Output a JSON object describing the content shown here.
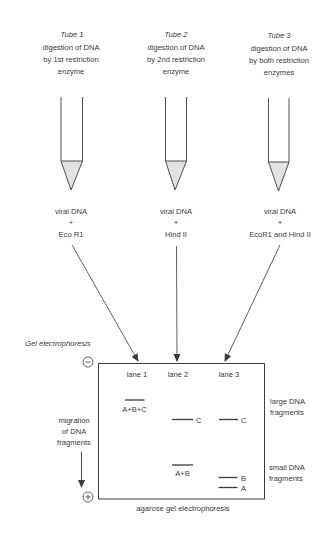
{
  "tubes": [
    {
      "title": "Tube 1",
      "description": [
        "digestion of DNA",
        "by 1st restriction",
        "enzyme"
      ],
      "contents": [
        "viral DNA",
        "+",
        "Eco R1"
      ]
    },
    {
      "title": "Tube 2",
      "description": [
        "digestion of DNA",
        "by 2nd restriction",
        "enzyme"
      ],
      "contents": [
        "viral DNA",
        "+",
        "Hind II"
      ]
    },
    {
      "title": "Tube 3",
      "description": [
        "digestion of DNA",
        "by both restriction",
        "enzymes"
      ],
      "contents": [
        "viral DNA",
        "+",
        "EcoR1 and Hind II"
      ]
    }
  ],
  "gel": {
    "title": "Gel electrophoresis",
    "negative_symbol": "−",
    "positive_symbol": "+",
    "lanes": [
      "lane 1",
      "lane 2",
      "lane 3"
    ],
    "bands": {
      "lane1": [
        {
          "label": "A+B+C"
        }
      ],
      "lane2": [
        {
          "label": "C"
        },
        {
          "label": "A+B"
        }
      ],
      "lane3": [
        {
          "label": "C"
        },
        {
          "label": "B"
        },
        {
          "label": "A"
        }
      ]
    },
    "right_labels": {
      "large": [
        "large DNA",
        "fragments"
      ],
      "small": [
        "small DNA",
        "fragments"
      ]
    },
    "migration_label": [
      "migration",
      "of DNA",
      "fragments"
    ],
    "caption": "agarose gel electrophoresis"
  },
  "colors": {
    "line": "#3a3a3a",
    "tube_fill": "#e2e2e2"
  }
}
